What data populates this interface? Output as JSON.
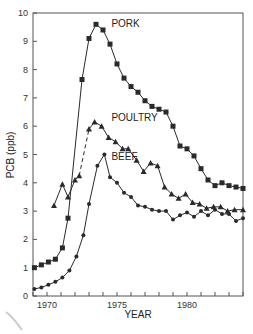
{
  "chart_data": {
    "type": "line",
    "title": "",
    "xlabel": "YEAR",
    "ylabel": "PCB (ppb)",
    "xlim": [
      1969,
      1984
    ],
    "ylim": [
      0,
      10
    ],
    "xticks": [
      1969,
      1970,
      1971,
      1972,
      1973,
      1974,
      1975,
      1976,
      1977,
      1978,
      1979,
      1980,
      1981,
      1982,
      1983,
      1984
    ],
    "xtick_labels": [
      {
        "x": 1970,
        "label": "1970"
      },
      {
        "x": 1975,
        "label": "1975"
      },
      {
        "x": 1980,
        "label": "1980"
      }
    ],
    "yticks": [
      0,
      1,
      2,
      3,
      4,
      5,
      6,
      7,
      8,
      9,
      10
    ],
    "ytick_labels": [
      "0",
      "1",
      "2",
      "3",
      "4",
      "5",
      "6",
      "7",
      "8",
      "9",
      "10"
    ],
    "grid": false,
    "legend": "inline labels near peaks",
    "series": [
      {
        "name": "PORK",
        "marker": "square",
        "label_pos": {
          "x": 1974.6,
          "y": 9.5
        },
        "points": [
          [
            1969.1,
            1.0
          ],
          [
            1969.6,
            1.1
          ],
          [
            1970.1,
            1.2
          ],
          [
            1970.6,
            1.3
          ],
          [
            1971.1,
            1.7
          ],
          [
            1971.5,
            2.75
          ],
          [
            1972.5,
            7.65
          ],
          [
            1973.0,
            9.1
          ],
          [
            1973.5,
            9.6
          ],
          [
            1974.0,
            9.4
          ],
          [
            1974.5,
            8.9
          ],
          [
            1975.0,
            8.2
          ],
          [
            1975.5,
            7.7
          ],
          [
            1976.0,
            7.4
          ],
          [
            1976.5,
            7.2
          ],
          [
            1977.0,
            6.9
          ],
          [
            1977.5,
            6.7
          ],
          [
            1978.0,
            6.6
          ],
          [
            1978.5,
            6.5
          ],
          [
            1979.0,
            6.0
          ],
          [
            1979.5,
            5.3
          ],
          [
            1980.0,
            5.2
          ],
          [
            1980.5,
            4.95
          ],
          [
            1981.0,
            4.5
          ],
          [
            1981.5,
            4.1
          ],
          [
            1982.0,
            3.9
          ],
          [
            1982.5,
            4.0
          ],
          [
            1983.0,
            3.9
          ],
          [
            1983.5,
            3.85
          ],
          [
            1984.0,
            3.8
          ]
        ]
      },
      {
        "name": "POULTRY",
        "marker": "triangle",
        "label_pos": {
          "x": 1974.6,
          "y": 6.2
        },
        "dashed_segment": [
          1972.3,
          1973.0
        ],
        "points": [
          [
            1970.5,
            3.2
          ],
          [
            1971.1,
            3.95
          ],
          [
            1971.5,
            3.5
          ],
          [
            1972.0,
            4.1
          ],
          [
            1972.3,
            4.25
          ],
          [
            1973.0,
            5.9
          ],
          [
            1973.4,
            6.15
          ],
          [
            1973.9,
            6.0
          ],
          [
            1974.4,
            5.6
          ],
          [
            1974.9,
            5.45
          ],
          [
            1975.4,
            5.2
          ],
          [
            1975.8,
            5.2
          ],
          [
            1976.4,
            4.8
          ],
          [
            1976.9,
            4.4
          ],
          [
            1977.4,
            4.7
          ],
          [
            1977.9,
            4.6
          ],
          [
            1978.4,
            3.85
          ],
          [
            1978.9,
            3.6
          ],
          [
            1979.4,
            3.45
          ],
          [
            1979.9,
            3.6
          ],
          [
            1980.4,
            3.3
          ],
          [
            1980.9,
            3.25
          ],
          [
            1981.4,
            3.1
          ],
          [
            1981.9,
            3.15
          ],
          [
            1982.4,
            3.15
          ],
          [
            1982.9,
            3.0
          ],
          [
            1983.4,
            3.05
          ],
          [
            1984.0,
            3.05
          ]
        ]
      },
      {
        "name": "BEEF",
        "marker": "circle",
        "label_pos": {
          "x": 1974.6,
          "y": 4.8
        },
        "points": [
          [
            1969.1,
            0.25
          ],
          [
            1969.6,
            0.3
          ],
          [
            1970.1,
            0.4
          ],
          [
            1970.6,
            0.5
          ],
          [
            1971.1,
            0.65
          ],
          [
            1971.6,
            0.9
          ],
          [
            1972.1,
            1.4
          ],
          [
            1972.6,
            2.15
          ],
          [
            1973.0,
            3.25
          ],
          [
            1973.6,
            4.6
          ],
          [
            1974.1,
            5.0
          ],
          [
            1974.5,
            4.2
          ],
          [
            1975.0,
            4.0
          ],
          [
            1975.5,
            3.65
          ],
          [
            1976.0,
            3.5
          ],
          [
            1976.5,
            3.2
          ],
          [
            1977.0,
            3.15
          ],
          [
            1977.5,
            3.05
          ],
          [
            1978.0,
            3.0
          ],
          [
            1978.5,
            3.0
          ],
          [
            1979.0,
            2.7
          ],
          [
            1979.5,
            2.85
          ],
          [
            1980.0,
            2.95
          ],
          [
            1980.5,
            2.8
          ],
          [
            1981.0,
            3.0
          ],
          [
            1981.5,
            2.85
          ],
          [
            1982.0,
            3.05
          ],
          [
            1982.5,
            2.9
          ],
          [
            1983.0,
            2.9
          ],
          [
            1983.5,
            2.65
          ],
          [
            1984.0,
            2.75
          ]
        ]
      }
    ]
  },
  "layout": {
    "plot": {
      "left": 33,
      "top": 13,
      "right": 243,
      "bottom": 296
    },
    "colors": {
      "line": "#2a2a2a",
      "axis": "#555555",
      "text": "#222222",
      "background": "#ffffff"
    }
  }
}
